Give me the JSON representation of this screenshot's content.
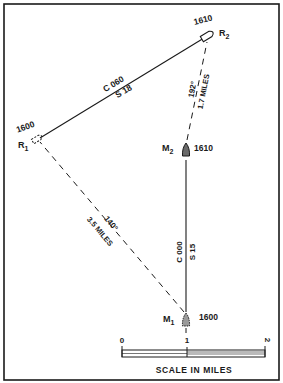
{
  "diagram": {
    "type": "relative-motion-plot",
    "stations": {
      "r1": {
        "label": "R",
        "sub": "1",
        "time": "1600"
      },
      "r2": {
        "label": "R",
        "sub": "2",
        "time": "1610"
      },
      "m1": {
        "label": "M",
        "sub": "1",
        "time": "1600"
      },
      "m2": {
        "label": "M",
        "sub": "2",
        "time": "1610"
      }
    },
    "legs": {
      "r1_r2": {
        "course": "C 060",
        "speed": "S 18"
      },
      "m1_m2": {
        "course": "C 000",
        "speed": "S 15"
      },
      "m1_r1": {
        "bearing": "140°",
        "range": "3.5 MILES"
      },
      "m2_r2": {
        "bearing": "192°",
        "range": "1.7 MILES"
      }
    },
    "scale": {
      "ticks": [
        "0",
        "1",
        "2"
      ],
      "caption": "SCALE IN MILES"
    }
  },
  "colors": {
    "ink": "#1a1a1a",
    "paper": "#ffffff"
  }
}
